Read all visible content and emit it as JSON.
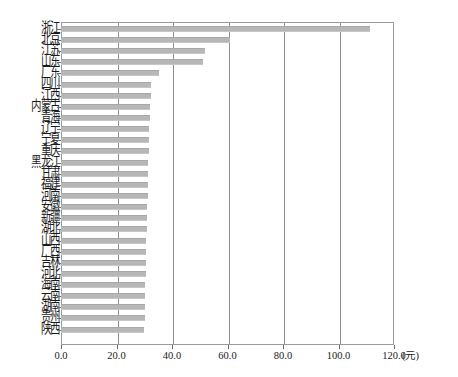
{
  "chart_data": {
    "type": "bar",
    "orientation": "horizontal",
    "title": "",
    "subtitle": "",
    "xlabel": "(元)",
    "ylabel": "",
    "xlim": [
      0.0,
      120.0
    ],
    "xticks": [
      "0.0",
      "20.0",
      "40.0",
      "60.0",
      "80.0",
      "100.0",
      "120.0"
    ],
    "xtick_values": [
      0,
      20,
      40,
      60,
      80,
      100,
      120
    ],
    "grid": "vertical",
    "legend": "none",
    "unit_label": "(元)",
    "bar_color": "#b7b7b7",
    "axis_color": "#8d8d8d",
    "categories": [
      "浙江",
      "北京",
      "江苏",
      "山东",
      "广东",
      "四川",
      "江西",
      "内蒙古",
      "青海",
      "辽宁",
      "宁夏",
      "重庆",
      "黑龙江",
      "甘肃",
      "福建",
      "河南",
      "安徽",
      "新疆",
      "湖北",
      "山西",
      "广西",
      "吉林",
      "河北",
      "海南",
      "云南",
      "湖南",
      "贵州",
      "陕西"
    ],
    "values": [
      111.2,
      61.0,
      52.0,
      51.0,
      35.2,
      32.4,
      32.3,
      32.0,
      31.9,
      31.8,
      31.7,
      31.6,
      31.5,
      31.4,
      31.3,
      31.2,
      31.1,
      31.0,
      30.9,
      30.8,
      30.7,
      30.6,
      30.5,
      30.4,
      30.3,
      30.2,
      30.1,
      29.9
    ]
  }
}
